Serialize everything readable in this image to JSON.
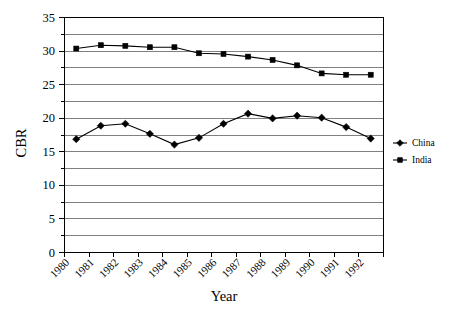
{
  "chart_data": {
    "type": "line",
    "title": "",
    "xlabel": "Year",
    "ylabel": "CBR",
    "categories": [
      "1980",
      "1981",
      "1982",
      "1983",
      "1984",
      "1985",
      "1986",
      "1987",
      "1988",
      "1989",
      "1990",
      "1991",
      "1992"
    ],
    "ylim": [
      0,
      35
    ],
    "ytick_step": 5,
    "yticks": [
      "0",
      "5",
      "10",
      "15",
      "20",
      "25",
      "30",
      "35"
    ],
    "gridline_step": 2.5,
    "grid": true,
    "legend_position": "right",
    "series": [
      {
        "name": "China",
        "marker": "diamond",
        "color": "#000000",
        "values": [
          16.8,
          18.8,
          19.1,
          17.6,
          16.0,
          17.0,
          19.1,
          20.6,
          19.9,
          20.3,
          20.0,
          18.6,
          16.9
        ]
      },
      {
        "name": "India",
        "marker": "square",
        "color": "#000000",
        "values": [
          30.3,
          30.8,
          30.7,
          30.5,
          30.5,
          29.6,
          29.5,
          29.1,
          28.6,
          27.8,
          26.6,
          26.4,
          26.4
        ]
      }
    ]
  },
  "axes": {
    "y_title": "CBR",
    "x_title": "Year"
  },
  "legend": {
    "items": [
      {
        "label": "China",
        "marker": "diamond-marker-icon"
      },
      {
        "label": "India",
        "marker": "square-marker-icon"
      }
    ]
  }
}
